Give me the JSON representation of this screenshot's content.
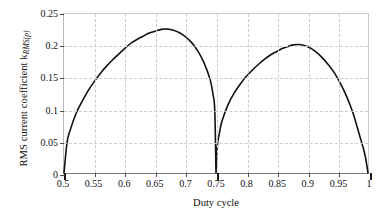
{
  "chart_data": {
    "type": "line",
    "title": "",
    "subtitle": "",
    "xlabel": "Duty cycle",
    "ylabel_text": "RMS current coefficient k",
    "ylabel_subscript": "RMS(p)",
    "ylabel_full": "RMS current coefficient k_RMS(p)",
    "xlim": [
      0.5,
      1.0
    ],
    "ylim": [
      0,
      0.25
    ],
    "grid": true,
    "legend": null,
    "xticks": [
      0.5,
      0.55,
      0.6,
      0.65,
      0.7,
      0.75,
      0.8,
      0.85,
      0.9,
      0.95,
      1
    ],
    "xtick_labels": [
      "0.5",
      "0.55",
      "0.6",
      "0.65",
      "0.7",
      "0.75",
      "0.8",
      "0.85",
      "0.9",
      "0.95",
      "1"
    ],
    "yticks": [
      0,
      0.05,
      0.1,
      0.15,
      0.2,
      0.25
    ],
    "ytick_labels": [
      "0",
      "0.05",
      "0.1",
      "0.15",
      "0.2",
      "0.25"
    ],
    "line_color": "#121212",
    "grid_color": "#cccccc",
    "annotations": [
      {
        "label": "first lobe peak",
        "x": 0.613,
        "y": 0.226
      },
      {
        "label": "cusp zero",
        "x": 0.75,
        "y": 0.0
      },
      {
        "label": "second lobe peak",
        "x": 0.877,
        "y": 0.202
      },
      {
        "label": "left zero",
        "x": 0.5,
        "y": 0.0
      },
      {
        "label": "right zero",
        "x": 1.0,
        "y": 0.0
      }
    ],
    "series": [
      {
        "name": "k_RMS(p)",
        "x": [
          0.5,
          0.505,
          0.51,
          0.52,
          0.53,
          0.54,
          0.55,
          0.56,
          0.57,
          0.58,
          0.59,
          0.6,
          0.61,
          0.613,
          0.62,
          0.63,
          0.64,
          0.65,
          0.66,
          0.67,
          0.68,
          0.69,
          0.7,
          0.71,
          0.72,
          0.73,
          0.74,
          0.745,
          0.748,
          0.75,
          0.752,
          0.755,
          0.76,
          0.77,
          0.78,
          0.79,
          0.8,
          0.81,
          0.82,
          0.83,
          0.84,
          0.85,
          0.86,
          0.87,
          0.877,
          0.885,
          0.895,
          0.905,
          0.915,
          0.925,
          0.935,
          0.945,
          0.955,
          0.965,
          0.975,
          0.985,
          0.992,
          0.996,
          1.0
        ],
        "y": [
          0.0,
          0.048,
          0.067,
          0.094,
          0.113,
          0.13,
          0.144,
          0.157,
          0.168,
          0.178,
          0.187,
          0.196,
          0.204,
          0.206,
          0.21,
          0.215,
          0.22,
          0.223,
          0.2258,
          0.2262,
          0.2245,
          0.2205,
          0.214,
          0.205,
          0.192,
          0.174,
          0.148,
          0.124,
          0.098,
          0.0,
          0.04,
          0.06,
          0.082,
          0.108,
          0.126,
          0.14,
          0.152,
          0.162,
          0.171,
          0.179,
          0.186,
          0.191,
          0.196,
          0.1995,
          0.2015,
          0.202,
          0.2005,
          0.1965,
          0.19,
          0.181,
          0.17,
          0.157,
          0.14,
          0.12,
          0.095,
          0.063,
          0.04,
          0.024,
          0.0
        ]
      }
    ]
  }
}
